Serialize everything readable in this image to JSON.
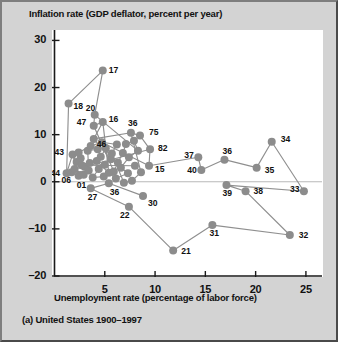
{
  "figure": {
    "caption": "(a) United States 1900–1997",
    "ylabel": "Inflation rate (GDP deflator, percent per year)",
    "xlabel": "Unemployment rate (percentage of labor force)"
  },
  "colors": {
    "marker": "#8c8c8c",
    "line": "#8f8f8f",
    "axis": "#1a1a1a",
    "plot_background": "#ffffff",
    "page_background": "#d3d3d3"
  },
  "chart_data": {
    "type": "scatter",
    "title": "(a) United States 1900–1997",
    "xlabel": "Unemployment rate (percentage of labor force)",
    "ylabel": "Inflation rate (GDP deflator, percent per year)",
    "xlim": [
      0,
      26.5
    ],
    "ylim": [
      -20,
      32
    ],
    "xticks": [
      5,
      10,
      15,
      20,
      25
    ],
    "yticks": [
      -20,
      -10,
      0,
      10,
      20,
      30
    ],
    "xtick_labels": [
      "5",
      "10",
      "15",
      "20",
      "25"
    ],
    "ytick_labels": [
      "-20",
      "-10",
      "0",
      "10",
      "20",
      "30"
    ],
    "grid": false,
    "legend": null,
    "zero_line": 0,
    "series_connected": true,
    "annotated_labels": [
      "17",
      "18",
      "20",
      "47",
      "16",
      "36",
      "75",
      "46",
      "82",
      "43",
      "15",
      "37",
      "36",
      "34",
      "44",
      "40",
      "35",
      "06",
      "01",
      "39",
      "38",
      "33",
      "27",
      "36",
      "30",
      "32",
      "22",
      "31",
      "21"
    ],
    "points": [
      {
        "label": "06",
        "x": 1.7,
        "y": 2.0,
        "show_label": true,
        "lx": -10,
        "ly": 11
      },
      {
        "label": "01",
        "x": 2.4,
        "y": 1.3,
        "show_label": true,
        "lx": -2,
        "ly": 12
      },
      {
        "label": "44",
        "x": 1.2,
        "y": 1.8,
        "show_label": true,
        "lx": -16,
        "ly": 3
      },
      {
        "label": "43",
        "x": 1.8,
        "y": 5.8,
        "show_label": true,
        "lx": -18,
        "ly": 1
      },
      {
        "label": "18",
        "x": 1.4,
        "y": 16.6,
        "show_label": true,
        "lx": 5,
        "ly": 5
      },
      {
        "label": "17",
        "x": 4.8,
        "y": 23.6,
        "show_label": true,
        "lx": 6,
        "ly": 2
      },
      {
        "label": "20",
        "x": 4.0,
        "y": 14.2,
        "show_label": true,
        "lx": -9,
        "ly": -4
      },
      {
        "label": "47",
        "x": 3.9,
        "y": 11.9,
        "show_label": true,
        "lx": -17,
        "ly": -1
      },
      {
        "label": "16",
        "x": 4.8,
        "y": 12.7,
        "show_label": true,
        "lx": 6,
        "ly": 0
      },
      {
        "label": "46",
        "x": 3.9,
        "y": 9.1,
        "show_label": true,
        "lx": 3,
        "ly": 8
      },
      {
        "label": "36",
        "x": 7.6,
        "y": 10.4,
        "show_label": true,
        "lx": -3,
        "ly": -7
      },
      {
        "label": "75",
        "x": 8.5,
        "y": 9.8,
        "show_label": true,
        "lx": 9,
        "ly": -1
      },
      {
        "label": "82",
        "x": 9.5,
        "y": 6.9,
        "show_label": true,
        "lx": 8,
        "ly": 2
      },
      {
        "label": "15",
        "x": 9.4,
        "y": 3.4,
        "show_label": true,
        "lx": 6,
        "ly": 6
      },
      {
        "label": "37",
        "x": 14.3,
        "y": 5.2,
        "show_label": true,
        "lx": -14,
        "ly": 1
      },
      {
        "label": "40",
        "x": 14.6,
        "y": 2.5,
        "show_label": true,
        "lx": -14,
        "ly": 3
      },
      {
        "label": "36b",
        "x": 16.9,
        "y": 4.7,
        "show_label": true,
        "lx": -2,
        "ly": -6
      },
      {
        "label": "35",
        "x": 20.1,
        "y": 3.0,
        "show_label": true,
        "lx": 8,
        "ly": 5
      },
      {
        "label": "34",
        "x": 21.6,
        "y": 8.5,
        "show_label": true,
        "lx": 9,
        "ly": 0
      },
      {
        "label": "33",
        "x": 24.8,
        "y": -2.0,
        "show_label": true,
        "lx": -14,
        "ly": 1
      },
      {
        "label": "39",
        "x": 17.1,
        "y": -0.7,
        "show_label": true,
        "lx": -4,
        "ly": 11
      },
      {
        "label": "38",
        "x": 19.0,
        "y": -2.0,
        "show_label": true,
        "lx": 8,
        "ly": 3
      },
      {
        "label": "32",
        "x": 23.4,
        "y": -11.3,
        "show_label": true,
        "lx": 9,
        "ly": 3
      },
      {
        "label": "31",
        "x": 15.7,
        "y": -9.2,
        "show_label": true,
        "lx": -3,
        "ly": 11
      },
      {
        "label": "21",
        "x": 11.8,
        "y": -14.6,
        "show_label": true,
        "lx": 8,
        "ly": 3
      },
      {
        "label": "22",
        "x": 7.4,
        "y": -5.3,
        "show_label": true,
        "lx": -9,
        "ly": 11
      },
      {
        "label": "27",
        "x": 3.6,
        "y": -1.4,
        "show_label": true,
        "lx": -3,
        "ly": 12
      },
      {
        "label": "36c",
        "x": 5.4,
        "y": -0.3,
        "show_label": true,
        "lx": 1,
        "ly": 12
      },
      {
        "label": "30",
        "x": 8.8,
        "y": -3.0,
        "show_label": true,
        "lx": 5,
        "ly": 10
      },
      {
        "label": "",
        "x": 2.2,
        "y": 4.2,
        "show_label": false,
        "lx": 0,
        "ly": 0
      },
      {
        "label": "",
        "x": 2.6,
        "y": 5.0,
        "show_label": false,
        "lx": 0,
        "ly": 0
      },
      {
        "label": "",
        "x": 3.0,
        "y": 3.2,
        "show_label": false,
        "lx": 0,
        "ly": 0
      },
      {
        "label": "",
        "x": 2.0,
        "y": 2.7,
        "show_label": false,
        "lx": 0,
        "ly": 0
      },
      {
        "label": "",
        "x": 2.9,
        "y": 1.5,
        "show_label": false,
        "lx": 0,
        "ly": 0
      },
      {
        "label": "",
        "x": 3.4,
        "y": 2.4,
        "show_label": false,
        "lx": 0,
        "ly": 0
      },
      {
        "label": "",
        "x": 3.3,
        "y": 6.6,
        "show_label": false,
        "lx": 0,
        "ly": 0
      },
      {
        "label": "",
        "x": 4.3,
        "y": 6.9,
        "show_label": false,
        "lx": 0,
        "ly": 0
      },
      {
        "label": "",
        "x": 4.6,
        "y": 5.3,
        "show_label": false,
        "lx": 0,
        "ly": 0
      },
      {
        "label": "",
        "x": 5.1,
        "y": 7.1,
        "show_label": false,
        "lx": 0,
        "ly": 0
      },
      {
        "label": "",
        "x": 5.6,
        "y": 4.8,
        "show_label": false,
        "lx": 0,
        "ly": 0
      },
      {
        "label": "",
        "x": 5.0,
        "y": 3.6,
        "show_label": false,
        "lx": 0,
        "ly": 0
      },
      {
        "label": "",
        "x": 4.4,
        "y": 2.7,
        "show_label": false,
        "lx": 0,
        "ly": 0
      },
      {
        "label": "",
        "x": 3.8,
        "y": 0.9,
        "show_label": false,
        "lx": 0,
        "ly": 0
      },
      {
        "label": "",
        "x": 4.9,
        "y": 1.1,
        "show_label": false,
        "lx": 0,
        "ly": 0
      },
      {
        "label": "",
        "x": 5.9,
        "y": 2.2,
        "show_label": false,
        "lx": 0,
        "ly": 0
      },
      {
        "label": "",
        "x": 6.3,
        "y": 4.1,
        "show_label": false,
        "lx": 0,
        "ly": 0
      },
      {
        "label": "",
        "x": 6.8,
        "y": 6.1,
        "show_label": false,
        "lx": 0,
        "ly": 0
      },
      {
        "label": "",
        "x": 7.1,
        "y": 8.0,
        "show_label": false,
        "lx": 0,
        "ly": 0
      },
      {
        "label": "",
        "x": 7.9,
        "y": 8.7,
        "show_label": false,
        "lx": 0,
        "ly": 0
      },
      {
        "label": "",
        "x": 8.3,
        "y": 6.6,
        "show_label": false,
        "lx": 0,
        "ly": 0
      },
      {
        "label": "",
        "x": 7.4,
        "y": 5.2,
        "show_label": false,
        "lx": 0,
        "ly": 0
      },
      {
        "label": "",
        "x": 6.6,
        "y": 3.0,
        "show_label": false,
        "lx": 0,
        "ly": 0
      },
      {
        "label": "",
        "x": 7.3,
        "y": 1.8,
        "show_label": false,
        "lx": 0,
        "ly": 0
      },
      {
        "label": "",
        "x": 6.1,
        "y": 0.7,
        "show_label": false,
        "lx": 0,
        "ly": 0
      },
      {
        "label": "",
        "x": 5.4,
        "y": 1.9,
        "show_label": false,
        "lx": 0,
        "ly": 0
      },
      {
        "label": "",
        "x": 4.2,
        "y": 4.4,
        "show_label": false,
        "lx": 0,
        "ly": 0
      },
      {
        "label": "",
        "x": 3.5,
        "y": 4.0,
        "show_label": false,
        "lx": 0,
        "ly": 0
      },
      {
        "label": "",
        "x": 2.7,
        "y": 3.5,
        "show_label": false,
        "lx": 0,
        "ly": 0
      },
      {
        "label": "",
        "x": 8.0,
        "y": 3.4,
        "show_label": false,
        "lx": 0,
        "ly": 0
      },
      {
        "label": "",
        "x": 8.6,
        "y": 2.0,
        "show_label": false,
        "lx": 0,
        "ly": 0
      },
      {
        "label": "",
        "x": 7.7,
        "y": 0.2,
        "show_label": false,
        "lx": 0,
        "ly": 0
      },
      {
        "label": "",
        "x": 6.9,
        "y": -0.2,
        "show_label": false,
        "lx": 0,
        "ly": 0
      },
      {
        "label": "",
        "x": 5.7,
        "y": 6.0,
        "show_label": false,
        "lx": 0,
        "ly": 0
      },
      {
        "label": "",
        "x": 6.2,
        "y": 7.9,
        "show_label": false,
        "lx": 0,
        "ly": 0
      },
      {
        "label": "",
        "x": 4.7,
        "y": 8.4,
        "show_label": false,
        "lx": 0,
        "ly": 0
      },
      {
        "label": "",
        "x": 3.6,
        "y": 7.6,
        "show_label": false,
        "lx": 0,
        "ly": 0
      },
      {
        "label": "",
        "x": 2.4,
        "y": 6.2,
        "show_label": false,
        "lx": 0,
        "ly": 0
      }
    ],
    "path_order": [
      "06",
      "01",
      "43",
      "44",
      "18",
      "17",
      "20",
      "47",
      "16",
      "46",
      "36",
      "75",
      "82",
      "15",
      "37",
      "40",
      "36b",
      "35",
      "34",
      "33",
      "39",
      "38",
      "32",
      "31",
      "21",
      "22",
      "27",
      "36c",
      "30"
    ]
  }
}
